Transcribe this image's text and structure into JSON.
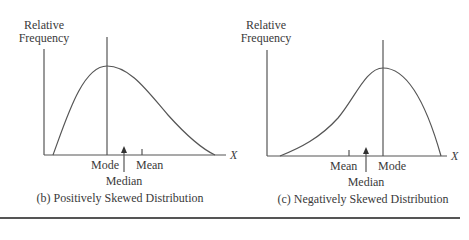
{
  "panels": [
    {
      "id": "b",
      "caption": "(b) Positively Skewed Distribution",
      "y_axis_label_line1": "Relative",
      "y_axis_label_line2": "Frequency",
      "x_axis_label": "X",
      "markers": {
        "mode": "Mode",
        "median": "Median",
        "mean": "Mean"
      },
      "order_left_to_right": [
        "Mode",
        "Median",
        "Mean"
      ]
    },
    {
      "id": "c",
      "caption": "(c) Negatively Skewed Distribution",
      "y_axis_label_line1": "Relative",
      "y_axis_label_line2": "Frequency",
      "x_axis_label": "X",
      "markers": {
        "mode": "Mode",
        "median": "Median",
        "mean": "Mean"
      },
      "order_left_to_right": [
        "Mean",
        "Median",
        "Mode"
      ]
    }
  ],
  "colors": {
    "line": "#555555",
    "text": "#3a3a3a",
    "background": "#ffffff"
  }
}
